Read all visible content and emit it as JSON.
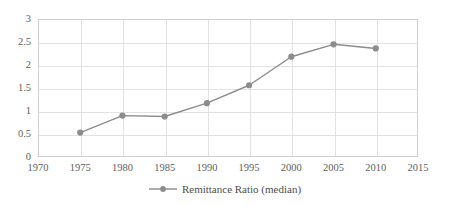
{
  "chart_data": {
    "type": "line",
    "title": "",
    "xlabel": "",
    "ylabel": "",
    "xlim": [
      1970,
      2015
    ],
    "ylim": [
      0,
      3
    ],
    "grid": true,
    "legend_position": "bottom",
    "x": [
      1975,
      1980,
      1985,
      1990,
      1995,
      2000,
      2005,
      2010
    ],
    "xticks": [
      "1970",
      "1975",
      "1980",
      "1985",
      "1990",
      "1995",
      "2000",
      "2005",
      "2010",
      "2015"
    ],
    "yticks": [
      "0",
      "0.5",
      "1",
      "1.5",
      "2",
      "2.5",
      "3"
    ],
    "series": [
      {
        "name": "Remittance Ratio (median)",
        "color": "#8c8c8c",
        "marker": "circle",
        "values": [
          0.53,
          0.9,
          0.88,
          1.17,
          1.56,
          2.18,
          2.45,
          2.36
        ]
      }
    ]
  },
  "legend": {
    "label": "Remittance Ratio (median)",
    "marker_name": "line-marker-swatch"
  },
  "colors": {
    "series": "#8c8c8c",
    "grid": "#e2e2e2",
    "border": "#d0d0d0",
    "text": "#5e5e5e",
    "background": "#ffffff"
  }
}
